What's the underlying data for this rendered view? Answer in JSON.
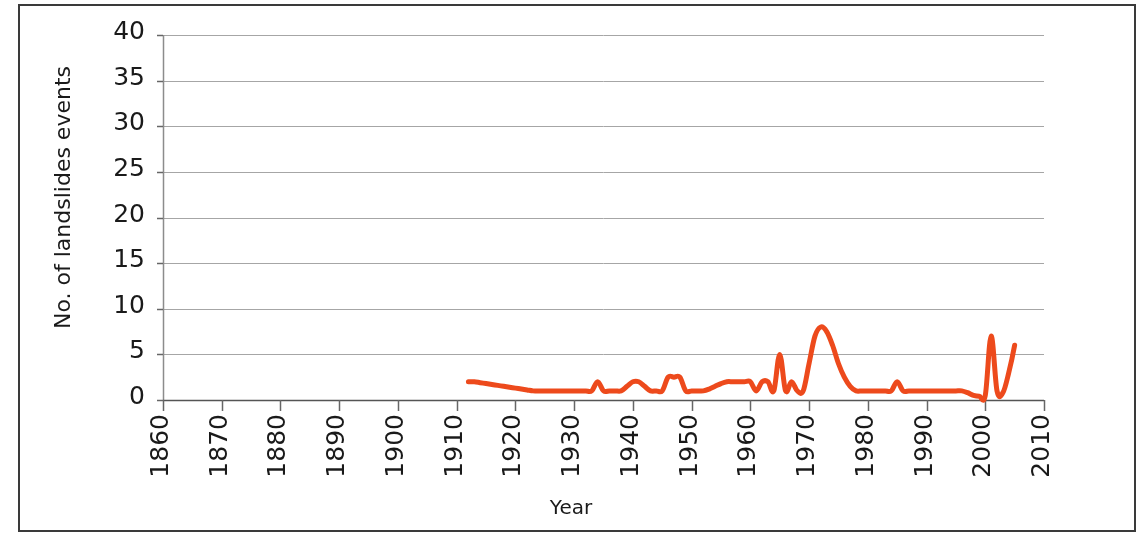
{
  "figure": {
    "background": "#ffffff",
    "border_color": "#3a3a3a"
  },
  "chart_data": {
    "type": "line",
    "title": "",
    "xlabel": "Year",
    "ylabel": "No. of landslides events",
    "xlim": [
      1860,
      2010
    ],
    "ylim": [
      0,
      40
    ],
    "ytick_step": 5,
    "xtick_step": 10,
    "grid": "horizontal",
    "line_color": "#ED4A1C",
    "line_width": 5,
    "legend": "none",
    "xticks": [
      "1860",
      "1870",
      "1880",
      "1890",
      "1900",
      "1910",
      "1920",
      "1930",
      "1940",
      "1950",
      "1960",
      "1970",
      "1980",
      "1990",
      "2000",
      "2010"
    ],
    "yticks": [
      "0",
      "5",
      "10",
      "15",
      "20",
      "25",
      "30",
      "35",
      "40"
    ],
    "x": [
      1912,
      1913,
      1914,
      1915,
      1916,
      1917,
      1918,
      1919,
      1920,
      1921,
      1922,
      1923,
      1924,
      1925,
      1926,
      1927,
      1928,
      1929,
      1930,
      1931,
      1932,
      1933,
      1934,
      1935,
      1936,
      1937,
      1938,
      1939,
      1940,
      1941,
      1942,
      1943,
      1944,
      1945,
      1946,
      1947,
      1948,
      1949,
      1950,
      1951,
      1952,
      1953,
      1954,
      1955,
      1956,
      1957,
      1958,
      1959,
      1960,
      1961,
      1962,
      1963,
      1964,
      1965,
      1966,
      1967,
      1968,
      1969,
      1970,
      1971,
      1972,
      1973,
      1974,
      1975,
      1976,
      1977,
      1978,
      1979,
      1980,
      1981,
      1982,
      1983,
      1984,
      1985,
      1986,
      1987,
      1988,
      1989,
      1990,
      1991,
      1992,
      1993,
      1994,
      1995,
      1996,
      1997,
      1998,
      1999,
      2000,
      2001,
      2002,
      2003,
      2004,
      2005,
      2006,
      2007
    ],
    "y": [
      2,
      2,
      1.9,
      1.8,
      1.7,
      1.6,
      1.5,
      1.4,
      1.3,
      1.2,
      1.1,
      1,
      1,
      1,
      1,
      1,
      1,
      1,
      1,
      1,
      1,
      1,
      2,
      1,
      1,
      1,
      1,
      1.5,
      2,
      2,
      1.5,
      1,
      1,
      1,
      2.5,
      2.5,
      2.5,
      1,
      1,
      1,
      1,
      1.2,
      1.5,
      1.8,
      2,
      2,
      2,
      2,
      2,
      1,
      2,
      2,
      1,
      5,
      1,
      2,
      1,
      1,
      4,
      7,
      8,
      7.5,
      6,
      4,
      2.5,
      1.5,
      1,
      1,
      1,
      1,
      1,
      1,
      1,
      2,
      1,
      1,
      1,
      1,
      1,
      1,
      1,
      1,
      1,
      1,
      1,
      0.8,
      0.5,
      0.4,
      0.5,
      7,
      1,
      0.8,
      3,
      6,
      10
    ],
    "series_name": "landslide events",
    "data_start_year": 1912,
    "data_end_year": 2007,
    "notable_peaks": [
      {
        "year": 1972,
        "value": 8
      },
      {
        "year": 2007,
        "value": 10
      },
      {
        "year": 2001,
        "value": 7
      },
      {
        "year": 1965,
        "value": 5
      }
    ]
  }
}
